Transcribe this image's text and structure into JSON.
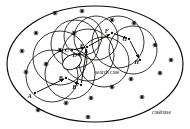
{
  "figure": {
    "domain_type": "diagram",
    "outer_region_label": "casebase",
    "query_label": "search case",
    "colors": {
      "ink": "#111111",
      "paper": "#fdfdfb",
      "outer_boundary": "#0d0d0d",
      "coverage_stroke": "#141414"
    },
    "nodes": [
      {
        "id": "A",
        "label": "A",
        "x": 35,
        "y": 93,
        "label_x": 32,
        "label_y": 98
      },
      {
        "id": "B",
        "label": "B",
        "x": 66,
        "y": 78,
        "label_x": 63,
        "label_y": 80
      },
      {
        "id": "Bp",
        "label": "B'",
        "x": 81,
        "y": 85,
        "label_x": 78,
        "label_y": 89
      },
      {
        "id": "C",
        "label": "C",
        "x": 72,
        "y": 50,
        "label_x": 69,
        "label_y": 52
      },
      {
        "id": "D",
        "label": "D",
        "x": 79,
        "y": 54,
        "label_x": 77,
        "label_y": 57
      },
      {
        "id": "E",
        "label": "E",
        "x": 87,
        "y": 47,
        "label_x": 84,
        "label_y": 48
      },
      {
        "id": "F",
        "label": "F",
        "x": 112,
        "y": 33,
        "label_x": 109,
        "label_y": 33
      },
      {
        "id": "G",
        "label": "G",
        "x": 129,
        "y": 39,
        "label_x": 127,
        "label_y": 41
      },
      {
        "id": "H",
        "label": "H",
        "x": 140,
        "y": 60,
        "label_x": 139,
        "label_y": 64
      }
    ],
    "path_edges": [
      {
        "from": "A",
        "to": "B"
      },
      {
        "from": "B",
        "to": "Bp"
      },
      {
        "from": "Bp",
        "to": "E"
      },
      {
        "from": "C",
        "to": "E"
      },
      {
        "from": "E",
        "to": "F"
      },
      {
        "from": "F",
        "to": "G"
      },
      {
        "from": "G",
        "to": "H"
      }
    ],
    "coverage_circles": [
      {
        "cx": 60,
        "cy": 58,
        "r": 27
      },
      {
        "cx": 75,
        "cy": 44,
        "r": 24
      },
      {
        "cx": 88,
        "cy": 55,
        "r": 26
      },
      {
        "cx": 70,
        "cy": 74,
        "r": 25
      },
      {
        "cx": 52,
        "cy": 76,
        "r": 26
      },
      {
        "cx": 96,
        "cy": 38,
        "r": 22
      },
      {
        "cx": 118,
        "cy": 42,
        "r": 26
      },
      {
        "cx": 133,
        "cy": 50,
        "r": 24
      },
      {
        "cx": 104,
        "cy": 62,
        "r": 25
      },
      {
        "cx": 83,
        "cy": 36,
        "r": 19
      }
    ],
    "outer_ellipse": {
      "cx": 95,
      "cy": 64,
      "rx": 88,
      "ry": 58
    },
    "search_blob": {
      "cx": 72,
      "cy": 62,
      "rx": 10,
      "ry": 7,
      "rotation": -28
    },
    "case_markers": [
      {
        "x": 55,
        "y": 13
      },
      {
        "x": 82,
        "y": 11
      },
      {
        "x": 112,
        "y": 20
      },
      {
        "x": 134,
        "y": 23
      },
      {
        "x": 36,
        "y": 33
      },
      {
        "x": 22,
        "y": 51
      },
      {
        "x": 74,
        "y": 33
      },
      {
        "x": 60,
        "y": 50
      },
      {
        "x": 155,
        "y": 45
      },
      {
        "x": 26,
        "y": 72
      },
      {
        "x": 46,
        "y": 64
      },
      {
        "x": 131,
        "y": 79
      },
      {
        "x": 160,
        "y": 73
      },
      {
        "x": 112,
        "y": 87
      },
      {
        "x": 91,
        "y": 98
      },
      {
        "x": 66,
        "y": 103
      },
      {
        "x": 142,
        "y": 97
      },
      {
        "x": 38,
        "y": 110
      },
      {
        "x": 88,
        "y": 117
      },
      {
        "x": 171,
        "y": 60
      }
    ]
  }
}
